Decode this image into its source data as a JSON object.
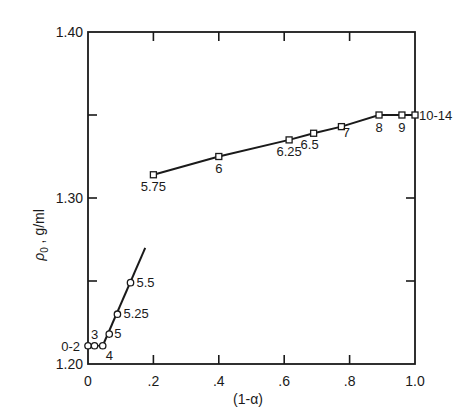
{
  "chart_data": {
    "type": "line",
    "title": "",
    "xlabel": "(1-α)",
    "ylabel": "ρ₀ , g/ml",
    "xlim": [
      0,
      1.0
    ],
    "ylim": [
      1.2,
      1.4
    ],
    "grid": false,
    "legend": null,
    "x_ticks": [
      0,
      0.2,
      0.4,
      0.6,
      0.8,
      1.0
    ],
    "x_tick_labels": [
      "0",
      ".2",
      ".4",
      ".6",
      ".8",
      "1.0"
    ],
    "y_ticks": [
      1.2,
      1.25,
      1.3,
      1.35,
      1.4
    ],
    "y_tick_labels": [
      "1.20",
      "",
      "1.30",
      "",
      "1.40"
    ],
    "series": [
      {
        "name": "low-range",
        "marker": "open-circle",
        "points": [
          {
            "x": 0.0,
            "y": 1.211,
            "label": "0-2"
          },
          {
            "x": 0.02,
            "y": 1.211,
            "label": "3"
          },
          {
            "x": 0.045,
            "y": 1.211,
            "label": "4"
          },
          {
            "x": 0.065,
            "y": 1.218,
            "label": "5"
          },
          {
            "x": 0.09,
            "y": 1.23,
            "label": "5.25"
          },
          {
            "x": 0.13,
            "y": 1.249,
            "label": "5.5"
          }
        ],
        "fit_line": [
          [
            0.045,
            1.211
          ],
          [
            0.175,
            1.27
          ]
        ]
      },
      {
        "name": "high-range",
        "marker": "open-square",
        "points": [
          {
            "x": 0.2,
            "y": 1.314,
            "label": "5.75"
          },
          {
            "x": 0.4,
            "y": 1.325,
            "label": "6"
          },
          {
            "x": 0.615,
            "y": 1.335,
            "label": "6.25"
          },
          {
            "x": 0.69,
            "y": 1.339,
            "label": "6.5"
          },
          {
            "x": 0.775,
            "y": 1.343,
            "label": "7"
          },
          {
            "x": 0.89,
            "y": 1.35,
            "label": "8"
          },
          {
            "x": 0.96,
            "y": 1.35,
            "label": "9"
          },
          {
            "x": 1.0,
            "y": 1.35,
            "label": "10-14"
          }
        ]
      }
    ]
  },
  "axes": {
    "x_title": "(1-α)",
    "y_title_rho": "ρ",
    "y_title_sub": "0",
    "y_title_units": " , g/ml"
  }
}
